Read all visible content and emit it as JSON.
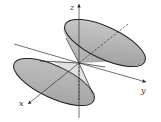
{
  "diagram": {
    "axes": [
      {
        "name": "x",
        "label": "x"
      },
      {
        "name": "y",
        "label": "y"
      },
      {
        "name": "z",
        "label": "z"
      }
    ],
    "colors": {
      "fill": "#b4b4b4",
      "fill_dark": "#8f8f8f",
      "stroke": "#222222",
      "axis": "#333333"
    }
  }
}
